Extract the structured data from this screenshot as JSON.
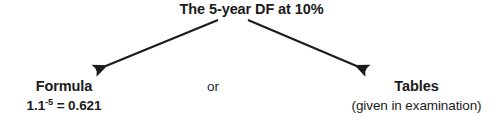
{
  "diagram": {
    "type": "tree",
    "background_color": "#ffffff",
    "text_color": "#1b1b1b",
    "arrow_color": "#1b1b1b",
    "root": {
      "label": "The 5-year DF at 10%"
    },
    "connector": {
      "label": "or"
    },
    "branches": [
      {
        "id": "formula",
        "title": "Formula",
        "sub_prefix": "1.1",
        "sub_exponent": "-5",
        "sub_suffix": " = 0.621"
      },
      {
        "id": "tables",
        "title": "Tables",
        "sub": "(given in examination)"
      }
    ],
    "arrows": [
      {
        "id": "arrow-to-formula",
        "direction": "down-left",
        "from_x": 218,
        "from_y": 20,
        "to_x": 91,
        "to_y": 72
      },
      {
        "id": "arrow-to-tables",
        "direction": "down-right",
        "from_x": 248,
        "from_y": 20,
        "to_x": 371,
        "to_y": 72
      }
    ]
  }
}
